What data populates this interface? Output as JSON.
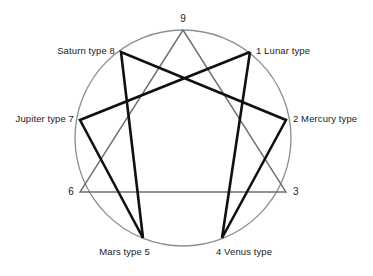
{
  "diagram": {
    "type": "enneagram",
    "colors": {
      "circle": "#8d8d8d",
      "triangle": "#6e6e6e",
      "hexad": "#111111",
      "text": "#1a1a1a",
      "background": "#ffffff"
    },
    "geometry": {
      "center_x": 183,
      "center_y": 138,
      "radius": 108,
      "circle_stroke_width": 1.3,
      "triangle_stroke_width": 1.4,
      "hexad_stroke_width": 2.6
    },
    "points": [
      {
        "number": "1",
        "label": "1  Lunar type",
        "name_only": "Lunar type",
        "x": 250,
        "y": 52,
        "angle_deg": 320,
        "label_x": 256,
        "label_y": 45,
        "align": "left"
      },
      {
        "number": "2",
        "label": "2  Mercury type",
        "name_only": "Mercury type",
        "x": 286,
        "y": 120,
        "angle_deg": 350,
        "label_x": 293,
        "label_y": 113,
        "align": "left"
      },
      {
        "number": "3",
        "label": "3",
        "name_only": "",
        "x": 286,
        "y": 192,
        "angle_deg": 30,
        "label_x": 293,
        "label_y": 186,
        "align": "left"
      },
      {
        "number": "4",
        "label": "4  Venus type",
        "name_only": "Venus type",
        "x": 222,
        "y": 238,
        "angle_deg": 60,
        "label_x": 216,
        "label_y": 246,
        "align": "left"
      },
      {
        "number": "5",
        "label": "Mars type  5",
        "name_only": "Mars type",
        "x": 143,
        "y": 238,
        "angle_deg": 100,
        "label_x": 150,
        "label_y": 246,
        "align": "right"
      },
      {
        "number": "6",
        "label": "6",
        "name_only": "",
        "x": 80,
        "y": 192,
        "angle_deg": 150,
        "label_x": 74,
        "label_y": 186,
        "align": "right"
      },
      {
        "number": "7",
        "label": "Jupiter type  7",
        "name_only": "Jupiter type",
        "x": 80,
        "y": 120,
        "angle_deg": 190,
        "label_x": 74,
        "label_y": 113,
        "align": "right"
      },
      {
        "number": "8",
        "label": "Saturn type  8",
        "name_only": "Saturn type",
        "x": 121,
        "y": 52,
        "angle_deg": 220,
        "label_x": 115,
        "label_y": 45,
        "align": "right"
      },
      {
        "number": "9",
        "label": "9",
        "name_only": "",
        "x": 183,
        "y": 30,
        "angle_deg": 270,
        "label_x": 183,
        "label_y": 13,
        "align": "center"
      }
    ],
    "triangle_sequence": [
      "9",
      "3",
      "6",
      "9"
    ],
    "hexad_sequence": [
      "1",
      "4",
      "2",
      "8",
      "5",
      "7",
      "1"
    ],
    "edges": [
      {
        "from": "9",
        "to": "3",
        "group": "triangle"
      },
      {
        "from": "3",
        "to": "6",
        "group": "triangle"
      },
      {
        "from": "6",
        "to": "9",
        "group": "triangle"
      },
      {
        "from": "1",
        "to": "4",
        "group": "hexad"
      },
      {
        "from": "4",
        "to": "2",
        "group": "hexad"
      },
      {
        "from": "2",
        "to": "8",
        "group": "hexad"
      },
      {
        "from": "8",
        "to": "5",
        "group": "hexad"
      },
      {
        "from": "5",
        "to": "7",
        "group": "hexad"
      },
      {
        "from": "7",
        "to": "1",
        "group": "hexad"
      }
    ]
  }
}
